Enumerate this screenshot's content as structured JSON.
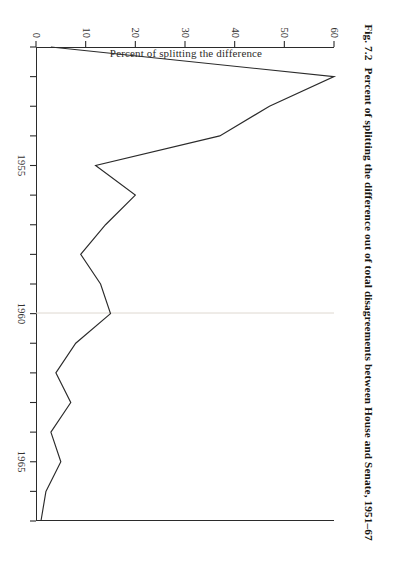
{
  "figure": {
    "number": "Fig. 7.2",
    "caption": "Percent of splitting the difference out of total disagreements between House and Senate, 1951–67",
    "full_caption": "Fig. 7.2  Percent of splitting the difference out of total disagreements between House and Senate, 1951–67"
  },
  "axes": {
    "y_title": "Percent of splitting the difference",
    "x_tick_labels": [
      "1955",
      "1960",
      "1965"
    ],
    "y_tick_labels": [
      "0",
      "10",
      "20",
      "30",
      "40",
      "50",
      "60"
    ]
  },
  "chart_data": {
    "type": "line",
    "title": "Percent of splitting the difference out of total disagreements between House and Senate, 1951–67",
    "xlabel": "",
    "ylabel": "Percent of splitting the difference",
    "xlim": [
      1951,
      1967
    ],
    "ylim": [
      0,
      60
    ],
    "xticks": [
      1955,
      1960,
      1965
    ],
    "yticks": [
      0,
      10,
      20,
      30,
      40,
      50,
      60
    ],
    "grid": false,
    "legend": null,
    "x": [
      1951,
      1952,
      1953,
      1954,
      1955,
      1956,
      1957,
      1958,
      1959,
      1960,
      1961,
      1962,
      1963,
      1964,
      1965,
      1966,
      1967
    ],
    "series": [
      {
        "name": "Percent of splitting the difference",
        "values": [
          3,
          60,
          47,
          37,
          12,
          20,
          14,
          9,
          13,
          15,
          8,
          4,
          7,
          3,
          5,
          2,
          1
        ],
        "color": "#2b2b2b"
      }
    ]
  },
  "colors": {
    "line": "#2b2b2b",
    "axis": "#2b2b2b",
    "text": "#17150f",
    "background": "#ffffff"
  }
}
